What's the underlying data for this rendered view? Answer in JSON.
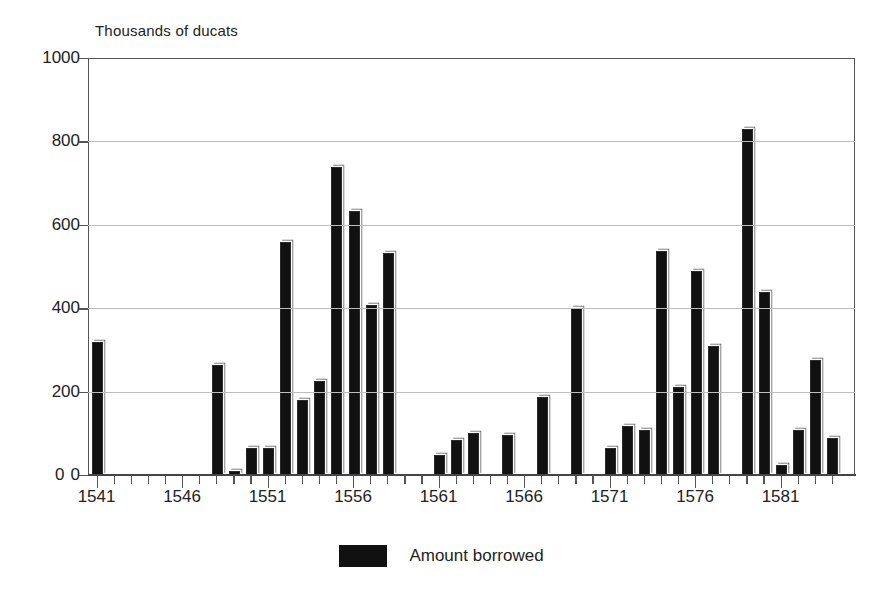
{
  "chart_data": {
    "type": "bar",
    "title": "",
    "subtitle": "",
    "ylabel": "Thousands of ducats",
    "xlabel": "",
    "ylim": [
      0,
      1000
    ],
    "ytick_values": [
      0,
      200,
      400,
      600,
      800,
      1000
    ],
    "ytick_labels": [
      "0",
      "200",
      "400",
      "600",
      "800",
      "1000"
    ],
    "grid": "horizontal",
    "legend": [
      {
        "label": "Amount borrowed",
        "color": "#111111"
      }
    ],
    "legend_position": "bottom-center",
    "xtick_labels": [
      "1541",
      "1546",
      "1551",
      "1556",
      "1561",
      "1566",
      "1571",
      "1576",
      "1581"
    ],
    "xtick_values": [
      1541,
      1546,
      1551,
      1556,
      1561,
      1566,
      1571,
      1576,
      1581
    ],
    "categories": [
      1541,
      1542,
      1543,
      1544,
      1545,
      1546,
      1547,
      1548,
      1549,
      1550,
      1551,
      1552,
      1553,
      1554,
      1555,
      1556,
      1557,
      1558,
      1559,
      1560,
      1561,
      1562,
      1563,
      1564,
      1565,
      1566,
      1567,
      1568,
      1569,
      1570,
      1571,
      1572,
      1573,
      1574,
      1575,
      1576,
      1577,
      1578,
      1579,
      1580,
      1581,
      1582,
      1583,
      1584
    ],
    "values": [
      318,
      0,
      0,
      0,
      0,
      0,
      0,
      265,
      10,
      65,
      65,
      558,
      180,
      225,
      738,
      632,
      408,
      533,
      0,
      0,
      48,
      85,
      100,
      0,
      95,
      0,
      188,
      0,
      400,
      0,
      65,
      118,
      108,
      538,
      210,
      490,
      310,
      0,
      830,
      440,
      25,
      108,
      275,
      88
    ]
  },
  "geometry": {
    "plot_left_px": 88,
    "plot_right_px": 855,
    "plot_top_px": 58,
    "baseline_px": 475,
    "tick_spacing_px": 17.1,
    "bar_width_px": 11
  }
}
